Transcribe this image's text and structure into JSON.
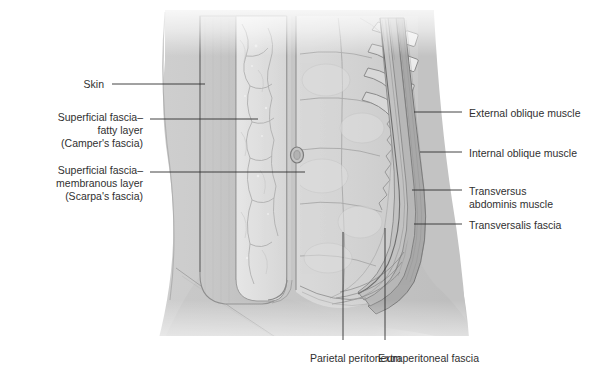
{
  "figure": {
    "view": "anterolateral dissection of the abdominal wall with reflected skin flap",
    "background_color": "#ffffff",
    "ink_color": "#303030",
    "skin_flap_color": "#c0c0c0",
    "body_color": "#c8c8c8",
    "fat_color": "#e2e2e2",
    "viscera_color": "#d5d5d5"
  },
  "labels": {
    "left": [
      {
        "id": "skin",
        "text": "Skin",
        "lines": [
          "Skin"
        ],
        "x": 104,
        "y": 78,
        "anchor": "right"
      },
      {
        "id": "campers",
        "text": "Superficial fascia– fatty layer (Camper's fascia)",
        "lines": [
          "Superficial fascia–",
          "fatty layer",
          "(Camper's fascia)"
        ],
        "x": 143,
        "y": 111,
        "anchor": "right"
      },
      {
        "id": "scarpas",
        "text": "Superficial fascia– membranous layer (Scarpa's fascia)",
        "lines": [
          "Superficial fascia–",
          "membranous layer",
          "(Scarpa's fascia)"
        ],
        "x": 143,
        "y": 164,
        "anchor": "right"
      }
    ],
    "right": [
      {
        "id": "external-oblique",
        "text": "External oblique muscle",
        "lines": [
          "External oblique muscle"
        ],
        "x": 469,
        "y": 107,
        "anchor": "left"
      },
      {
        "id": "internal-oblique",
        "text": "Internal oblique muscle",
        "lines": [
          "Internal oblique muscle"
        ],
        "x": 469,
        "y": 147,
        "anchor": "left"
      },
      {
        "id": "transversus-abdominis",
        "text": "Transversus abdominis muscle",
        "lines": [
          "Transversus",
          "abdominis muscle"
        ],
        "x": 469,
        "y": 185,
        "anchor": "left"
      },
      {
        "id": "transversalis-fascia",
        "text": "Transversalis fascia",
        "lines": [
          "Transversalis fascia"
        ],
        "x": 469,
        "y": 219,
        "anchor": "left"
      }
    ],
    "bottom": [
      {
        "id": "parietal-peritoneum",
        "text": "Parietal peritoneum",
        "lines": [
          "Parietal peritoneum"
        ],
        "x": 310,
        "y": 352,
        "anchor": "left"
      },
      {
        "id": "extraperitoneal-fascia",
        "text": "Extraperitoneal fascia",
        "lines": [
          "Extraperitoneal fascia"
        ],
        "x": 378,
        "y": 352,
        "anchor": "left"
      }
    ]
  },
  "leaders": {
    "skin": {
      "x1": 112,
      "y1": 84,
      "x2": 205,
      "y2": 84
    },
    "campers": {
      "x1": 150,
      "y1": 119,
      "x2": 258,
      "y2": 119
    },
    "scarpas": {
      "x1": 150,
      "y1": 172,
      "x2": 305,
      "y2": 172
    },
    "external-oblique": {
      "x1": 462,
      "y1": 112,
      "x2": 414,
      "y2": 112
    },
    "internal-oblique": {
      "x1": 462,
      "y1": 152,
      "x2": 420,
      "y2": 152
    },
    "transversus-abdominis": {
      "x1": 462,
      "y1": 190,
      "x2": 412,
      "y2": 190
    },
    "transversalis-fascia": {
      "x1": 462,
      "y1": 224,
      "x2": 414,
      "y2": 224
    },
    "parietal-peritoneum": {
      "x1": 343,
      "y1": 340,
      "x2": 343,
      "y2": 232
    },
    "extraperitoneal-fascia": {
      "x1": 385,
      "y1": 340,
      "x2": 385,
      "y2": 228
    }
  },
  "structures": [
    {
      "name": "skin-flap-panel",
      "note": "reflected sheet of skin, flat gray band"
    },
    {
      "name": "camper-fatty-layer",
      "note": "pale fat with branching subcutaneous vessels"
    },
    {
      "name": "scarpa-membranous-layer",
      "note": "thin membranous sheet deep to fat"
    },
    {
      "name": "rectus-abdominis",
      "note": "segmented muscle belly with tendinous intersections"
    },
    {
      "name": "umbilicus",
      "note": "small oval depression on midline"
    },
    {
      "name": "costal-margin-ribs",
      "note": "ribs with costal cartilages, upper right"
    },
    {
      "name": "flank-muscle-layers",
      "note": "three overlapping oblique/transversus bands"
    },
    {
      "name": "iliac-crest-contour",
      "note": "lower body contour and inguinal crease"
    }
  ]
}
